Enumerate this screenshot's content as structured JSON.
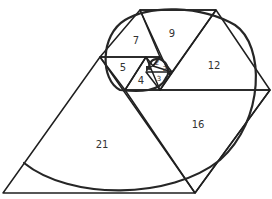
{
  "diagram": {
    "colors": {
      "stroke": "#1f1f1f",
      "spiral": "#262626",
      "background": "#ffffff",
      "label": "#333333"
    },
    "labels": [
      {
        "text": "21",
        "x": 102,
        "y": 145
      },
      {
        "text": "16",
        "x": 198,
        "y": 125
      },
      {
        "text": "12",
        "x": 214,
        "y": 66
      },
      {
        "text": "9",
        "x": 172,
        "y": 34
      },
      {
        "text": "7",
        "x": 136,
        "y": 41
      },
      {
        "text": "5",
        "x": 123,
        "y": 68
      },
      {
        "text": "4",
        "x": 141,
        "y": 81
      },
      {
        "text": "3",
        "x": 159,
        "y": 79
      },
      {
        "text": "2",
        "x": 157,
        "y": 63
      },
      {
        "text": "2",
        "x": 165,
        "y": 69
      }
    ]
  }
}
